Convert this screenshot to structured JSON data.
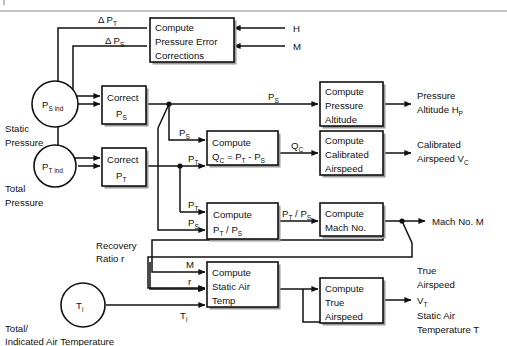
{
  "figure": {
    "rule_color": "#8a8a8a",
    "line_color": "#111111",
    "box_fill": "#ffffff",
    "box_stroke": "#111111",
    "shadow_color": "#9a9a9a"
  },
  "inputs": [
    {
      "id": "ps-ind",
      "symbol": "P",
      "sub": "S ind",
      "caption_line1": "Static",
      "caption_line2": "Pressure"
    },
    {
      "id": "pt-ind",
      "symbol": "P",
      "sub": "T ind",
      "caption_line1": "Total",
      "caption_line2": "Pressure"
    },
    {
      "id": "ti",
      "symbol": "T",
      "sub": "i",
      "caption_line1": "Total/",
      "caption_line2": "Indicated Air Temperature"
    }
  ],
  "boxes": [
    {
      "id": "pressure-error",
      "lines": [
        "Compute",
        "Pressure Error",
        "Corrections"
      ]
    },
    {
      "id": "correct-ps",
      "lines": [
        "Correct",
        "PS"
      ]
    },
    {
      "id": "correct-pt",
      "lines": [
        "Correct",
        "PT"
      ]
    },
    {
      "id": "pressure-altitude",
      "lines": [
        "Compute",
        "Pressure",
        "Altitude"
      ]
    },
    {
      "id": "compute-qc",
      "lines": [
        "Compute",
        "QC = PT - PS"
      ]
    },
    {
      "id": "calibrated-as",
      "lines": [
        "Compute",
        "Calibrated",
        "Airspeed"
      ]
    },
    {
      "id": "compute-ratio",
      "lines": [
        "Compute",
        "PT / PS"
      ]
    },
    {
      "id": "mach-no",
      "lines": [
        "Compute",
        "Mach No."
      ]
    },
    {
      "id": "static-air-temp",
      "lines": [
        "Compute",
        "Static Air",
        "Temp"
      ]
    },
    {
      "id": "true-airspeed",
      "lines": [
        "Compute",
        "True",
        "Airspeed"
      ]
    }
  ],
  "box_text": {
    "compute": "Compute",
    "pressure_error": "Pressure Error",
    "corrections": "Corrections",
    "correct": "Correct",
    "pressure": "Pressure",
    "altitude": "Altitude",
    "calibrated": "Calibrated",
    "airspeed": "Airspeed",
    "mach_no": "Mach No.",
    "static_air": "Static Air",
    "temp": "Temp",
    "true": "True"
  },
  "signal_labels": {
    "delta_pt": {
      "main": "Δ P",
      "sub": "T"
    },
    "delta_ps": {
      "main": "Δ P",
      "sub": "S"
    },
    "h": {
      "main": "H",
      "sub": ""
    },
    "m_top": {
      "main": "M",
      "sub": ""
    },
    "ps_alt": {
      "main": "P",
      "sub": "S"
    },
    "ps_qc": {
      "main": "P",
      "sub": "S"
    },
    "pt_qc": {
      "main": "P",
      "sub": "T"
    },
    "qc": {
      "main": "Q",
      "sub": "C"
    },
    "pt_ratio": {
      "main": "P",
      "sub": "T"
    },
    "ps_ratio": {
      "main": "P",
      "sub": "S"
    },
    "ratio_out": {
      "main": "P",
      "sub": "T",
      "main2": " / P",
      "sub2": "S"
    },
    "m_sat": {
      "main": "M",
      "sub": ""
    },
    "r_sat": {
      "main": "r",
      "sub": ""
    },
    "ti_sat": {
      "main": "T",
      "sub": "i"
    }
  },
  "annotations": {
    "recovery_line1": "Recovery",
    "recovery_line2": "Ratio  r"
  },
  "outputs": [
    {
      "id": "pressure-altitude-out",
      "line1": "Pressure",
      "line2": "Altitude H",
      "sub2": "P",
      "line3": ""
    },
    {
      "id": "calibrated-out",
      "line1": "Calibrated",
      "line2": "Airspeed V",
      "sub2": "C",
      "line3": ""
    },
    {
      "id": "mach-out",
      "line1": "Mach No. M",
      "line2": "",
      "sub2": "",
      "line3": ""
    },
    {
      "id": "true-airspeed-out",
      "line1": "True",
      "line2": "Airspeed",
      "line3": "V",
      "sub3": "T"
    },
    {
      "id": "sat-out",
      "line1": "Static Air",
      "line2": "Temperature T",
      "sub2": "",
      "line3": ""
    }
  ],
  "qc_formula": {
    "q": "Q",
    "qsub": "C",
    "eq": " = P",
    "tsub": "T",
    "minus": " - P",
    "ssub": "S"
  }
}
